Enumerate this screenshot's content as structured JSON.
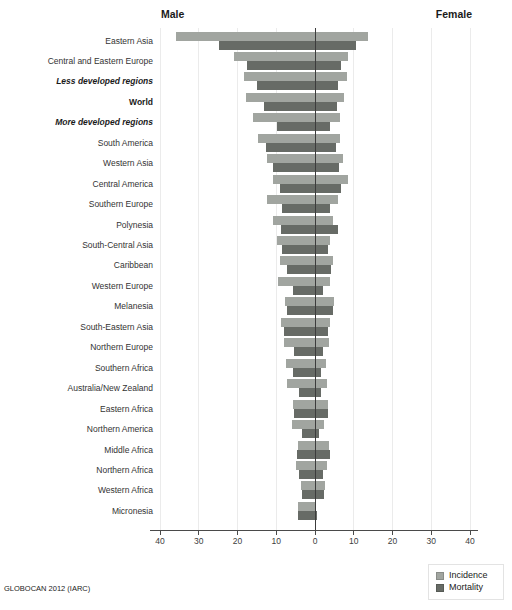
{
  "chart_data": {
    "type": "bar",
    "subtype": "diverging-population-pyramid",
    "title": "",
    "left_header": "Male",
    "right_header": "Female",
    "source": "GLOBOCAN 2012 (IARC)",
    "xlim": [
      -40,
      40
    ],
    "grid": true,
    "legend_position": "bottom-right",
    "x_tick_values": [
      -40,
      -30,
      -20,
      -10,
      0,
      10,
      20,
      30,
      40
    ],
    "x_tick_labels": [
      "40",
      "30",
      "20",
      "10",
      "0",
      "10",
      "20",
      "30",
      "40"
    ],
    "series": [
      {
        "name": "Incidence",
        "color": "#a1a5a0"
      },
      {
        "name": "Mortality",
        "color": "#676b66"
      }
    ],
    "grid_color": "#ebebeb",
    "zero_line_color": "#3c3c3c",
    "axis_color": "#4a4a4a",
    "regions": [
      {
        "label": "Eastern Asia",
        "style": "normal",
        "incidence_male": 35.8,
        "incidence_female": 13.8,
        "mortality_male": 24.7,
        "mortality_female": 10.5
      },
      {
        "label": "Central and Eastern Europe",
        "style": "normal",
        "incidence_male": 20.8,
        "incidence_female": 8.5,
        "mortality_male": 17.6,
        "mortality_female": 6.7
      },
      {
        "label": "Less developed regions",
        "style": "bold-italic",
        "incidence_male": 18.2,
        "incidence_female": 8.2,
        "mortality_male": 14.9,
        "mortality_female": 6.0
      },
      {
        "label": "World",
        "style": "bold",
        "incidence_male": 17.8,
        "incidence_female": 7.5,
        "mortality_male": 13.1,
        "mortality_female": 5.8
      },
      {
        "label": "More developed regions",
        "style": "bold-italic",
        "incidence_male": 15.9,
        "incidence_female": 6.5,
        "mortality_male": 9.7,
        "mortality_female": 3.9
      },
      {
        "label": "South America",
        "style": "normal",
        "incidence_male": 14.8,
        "incidence_female": 6.5,
        "mortality_male": 12.7,
        "mortality_female": 5.4
      },
      {
        "label": "Western Asia",
        "style": "normal",
        "incidence_male": 12.3,
        "incidence_female": 7.1,
        "mortality_male": 10.8,
        "mortality_female": 6.2
      },
      {
        "label": "Central America",
        "style": "normal",
        "incidence_male": 10.9,
        "incidence_female": 8.6,
        "mortality_male": 9.0,
        "mortality_female": 6.7
      },
      {
        "label": "Southern Europe",
        "style": "normal",
        "incidence_male": 12.3,
        "incidence_female": 6.0,
        "mortality_male": 8.6,
        "mortality_female": 3.9
      },
      {
        "label": "Polynesia",
        "style": "normal",
        "incidence_male": 10.9,
        "incidence_female": 4.6,
        "mortality_male": 8.8,
        "mortality_female": 5.9
      },
      {
        "label": "South-Central Asia",
        "style": "normal",
        "incidence_male": 9.9,
        "incidence_female": 3.9,
        "mortality_male": 8.6,
        "mortality_female": 3.4
      },
      {
        "label": "Caribbean",
        "style": "normal",
        "incidence_male": 9.0,
        "incidence_female": 4.6,
        "mortality_male": 7.1,
        "mortality_female": 4.1
      },
      {
        "label": "Western Europe",
        "style": "normal",
        "incidence_male": 9.6,
        "incidence_female": 3.9,
        "mortality_male": 5.6,
        "mortality_female": 2.0
      },
      {
        "label": "Melanesia",
        "style": "normal",
        "incidence_male": 7.7,
        "incidence_female": 5.0,
        "mortality_male": 7.3,
        "mortality_female": 4.6
      },
      {
        "label": "South-Eastern Asia",
        "style": "normal",
        "incidence_male": 8.8,
        "incidence_female": 3.9,
        "mortality_male": 7.9,
        "mortality_female": 3.4
      },
      {
        "label": "Northern Europe",
        "style": "normal",
        "incidence_male": 7.9,
        "incidence_female": 3.6,
        "mortality_male": 5.3,
        "mortality_female": 2.1
      },
      {
        "label": "Southern Africa",
        "style": "normal",
        "incidence_male": 7.6,
        "incidence_female": 2.8,
        "mortality_male": 5.8,
        "mortality_female": 1.5
      },
      {
        "label": "Australia/New Zealand",
        "style": "normal",
        "incidence_male": 7.1,
        "incidence_female": 3.1,
        "mortality_male": 4.1,
        "mortality_female": 1.5
      },
      {
        "label": "Eastern Africa",
        "style": "normal",
        "incidence_male": 5.8,
        "incidence_female": 3.4,
        "mortality_male": 5.4,
        "mortality_female": 3.4
      },
      {
        "label": "Northern America",
        "style": "normal",
        "incidence_male": 6.0,
        "incidence_female": 2.4,
        "mortality_male": 3.4,
        "mortality_female": 1.0
      },
      {
        "label": "Middle Africa",
        "style": "normal",
        "incidence_male": 4.5,
        "incidence_female": 3.7,
        "mortality_male": 4.7,
        "mortality_female": 3.9
      },
      {
        "label": "Northern Africa",
        "style": "normal",
        "incidence_male": 5.0,
        "incidence_female": 3.0,
        "mortality_male": 4.1,
        "mortality_female": 2.1
      },
      {
        "label": "Western Africa",
        "style": "normal",
        "incidence_male": 3.6,
        "incidence_female": 2.6,
        "mortality_male": 3.4,
        "mortality_female": 2.4
      },
      {
        "label": "Micronesia",
        "style": "normal",
        "incidence_male": 4.3,
        "incidence_female": 0.3,
        "mortality_male": 4.3,
        "mortality_female": 0.6
      }
    ]
  }
}
